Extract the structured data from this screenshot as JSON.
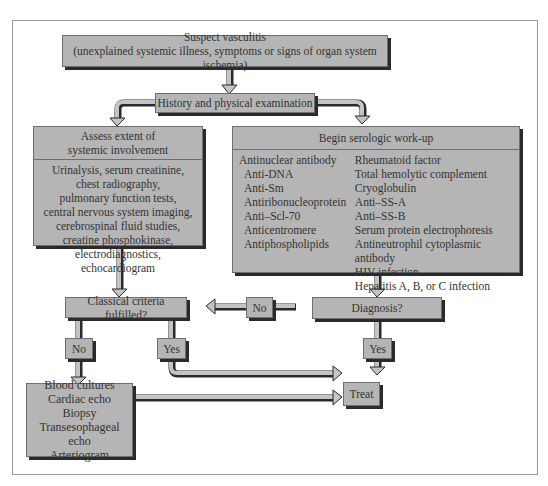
{
  "diagram": {
    "type": "flowchart",
    "nodes": {
      "suspect": {
        "title": "Suspect vasculitis",
        "subtitle": "(unexplained systemic illness, symptoms or signs of organ system ischemia)"
      },
      "history": {
        "label": "History and physical examination"
      },
      "assess": {
        "header_line1": "Assess extent of",
        "header_line2": "systemic involvement",
        "items": [
          "Urinalysis, serum creatinine,",
          "chest radiography,",
          "pulmonary function tests,",
          "central nervous system imaging,",
          "cerebrospinal fluid studies,",
          "creatine phosphokinase,",
          "electrodiagnostics, echocardiogram"
        ]
      },
      "serologic": {
        "header": "Begin serologic work-up",
        "col1": [
          "Antinuclear antibody",
          "Anti-DNA",
          "Anti-Sm",
          "Antiribonucleoprotein",
          "Anti–Scl-70",
          "Anticentromere",
          "Antiphospholipids"
        ],
        "col2": [
          "Rheumatoid factor",
          "Total hemolytic complement",
          "Cryoglobulin",
          "Anti–SS-A",
          "Anti–SS-B",
          "Serum protein electrophoresis",
          "Antineutrophil cytoplasmic antibody",
          "HIV infection",
          "Hepatitis A, B, or C infection"
        ]
      },
      "classical": {
        "label": "Classical criteria fulfilled?"
      },
      "diagnosis": {
        "label": "Diagnosis?"
      },
      "no_mid": {
        "label": "No"
      },
      "no_left": {
        "label": "No"
      },
      "yes_left": {
        "label": "Yes"
      },
      "yes_right": {
        "label": "Yes"
      },
      "treat": {
        "label": "Treat"
      },
      "further": {
        "items": [
          "Blood cultures",
          "Cardiac echo",
          "Biopsy",
          "Transesophageal echo",
          "Arteriogram"
        ]
      }
    },
    "edges": [
      [
        "suspect",
        "history"
      ],
      [
        "history",
        "assess"
      ],
      [
        "history",
        "serologic"
      ],
      [
        "assess",
        "classical"
      ],
      [
        "serologic",
        "diagnosis"
      ],
      [
        "diagnosis",
        "classical",
        "No"
      ],
      [
        "diagnosis",
        "treat",
        "Yes"
      ],
      [
        "classical",
        "further",
        "No"
      ],
      [
        "classical",
        "treat",
        "Yes"
      ],
      [
        "further",
        "treat"
      ]
    ],
    "colors": {
      "box_fill": "#b5b5b5",
      "box_shadow": "#2a2a2a",
      "arrow_fill": "#c4c4c4",
      "arrow_outline": "#2a2a2a"
    }
  }
}
